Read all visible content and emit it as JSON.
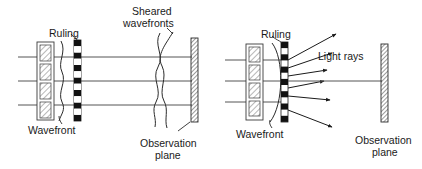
{
  "figure": {
    "type": "optical-schematic",
    "background_color": "#ffffff",
    "stroke_color": "#1a1a1a",
    "line_color": "#555555",
    "panels": [
      {
        "id": "left-panel",
        "name": "shearing-interferometer-panel",
        "labels": {
          "ruling": "Ruling",
          "wavefront": "Wavefront",
          "sheared_wavefronts": "Sheared\nwavefronts",
          "sheared_wavefronts_line1": "Sheared",
          "sheared_wavefronts_line2": "wavefronts",
          "observation_plane": "Observation\nplane",
          "observation_plane_line1": "Observation",
          "observation_plane_line2": "plane"
        },
        "elements": {
          "optic_cells": 4,
          "ruling_segments": 13,
          "incoming_beam_lines": 3,
          "sheared_wavefront_curves": 2,
          "observation_plane_hatched": true
        }
      },
      {
        "id": "right-panel",
        "name": "ray-diagram-panel",
        "labels": {
          "ruling": "Ruling",
          "wavefront": "Wavefront",
          "light_rays": "Light rays",
          "observation_plane": "Observation\nplane",
          "observation_plane_line1": "Observation",
          "observation_plane_line2": "plane"
        },
        "elements": {
          "optic_cells": 4,
          "ruling_segments": 13,
          "incoming_beam_lines": 3,
          "light_ray_count": 6,
          "curved_wavefront": true,
          "observation_plane_hatched": true
        }
      }
    ]
  }
}
